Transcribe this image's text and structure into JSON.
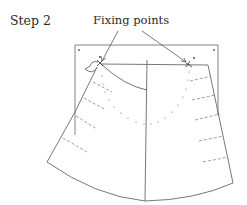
{
  "diagram": {
    "step_label": "Step 2",
    "annotation": "Fixing points",
    "elements": {
      "board": "rectangular pinning board with corner pin marks",
      "skirt_pattern": "flared skirt pattern piece split into two panels by a center line",
      "fixing_points": [
        "left waist fixing pin",
        "right waist fixing pin"
      ],
      "guide_lines": [
        "curved dotted hip line",
        "dashed drape marks on left panel",
        "dashed drape marks on right panel"
      ]
    },
    "colors": {
      "line": "#555555",
      "text": "#2a2a2a",
      "background": "#ffffff"
    }
  }
}
